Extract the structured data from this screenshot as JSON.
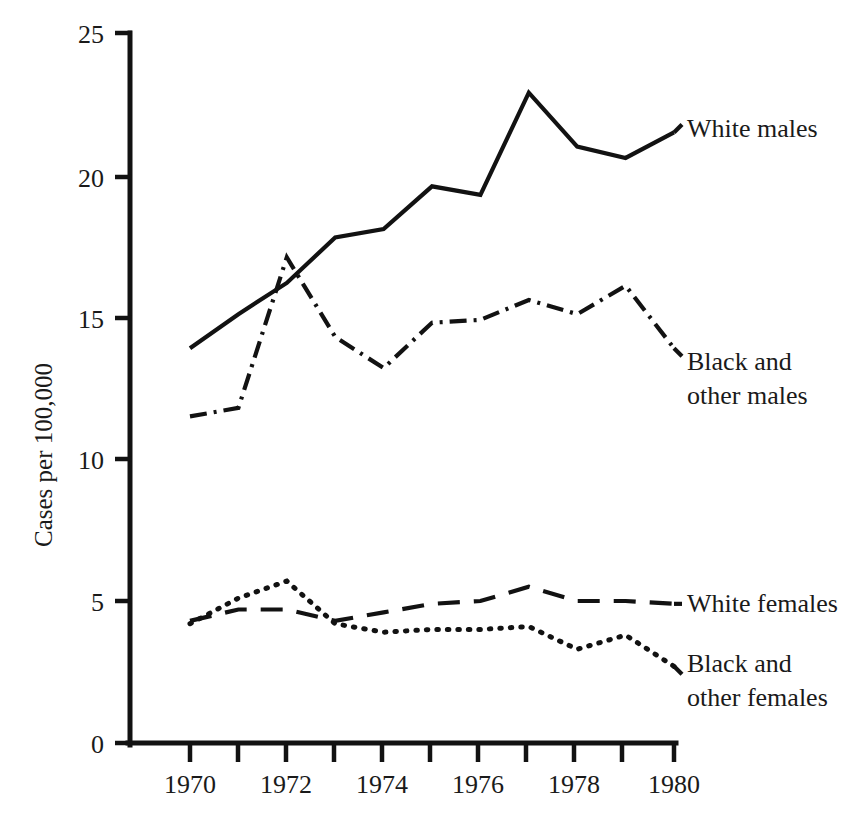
{
  "chart_data": {
    "type": "line",
    "title": "",
    "xlabel": "",
    "ylabel": "Cases per 100,000",
    "x": [
      1970,
      1971,
      1972,
      1973,
      1974,
      1975,
      1976,
      1977,
      1978,
      1979,
      1980
    ],
    "xlim": [
      1969.5,
      1980.5
    ],
    "ylim": [
      0,
      25
    ],
    "yticks": [
      0,
      5,
      10,
      15,
      20,
      25
    ],
    "ytick_labels": [
      "0",
      "5",
      "10",
      "15",
      "20",
      "25"
    ],
    "xticks": [
      1970,
      1971,
      1972,
      1973,
      1974,
      1975,
      1976,
      1977,
      1978,
      1979,
      1980
    ],
    "xtick_labels": [
      "1970",
      "",
      "1972",
      "",
      "1974",
      "",
      "1976",
      "",
      "1978",
      "",
      "1980"
    ],
    "xtick_labels_shown": [
      "1970",
      "1972",
      "1974",
      "1976",
      "1978",
      "1980"
    ],
    "grid": false,
    "legend_position": "right-inline-labels",
    "series": [
      {
        "name": "White males",
        "style": "solid",
        "values": [
          13.9,
          15.1,
          16.2,
          17.8,
          18.1,
          19.6,
          19.3,
          22.9,
          21.0,
          20.6,
          21.5
        ]
      },
      {
        "name": "Black and other males",
        "style": "dash-dot",
        "values": [
          11.5,
          11.8,
          17.1,
          14.3,
          13.2,
          14.8,
          14.9,
          15.6,
          15.1,
          16.1,
          13.9
        ]
      },
      {
        "name": "White females",
        "style": "dashed",
        "values": [
          4.3,
          4.7,
          4.7,
          4.3,
          4.6,
          4.9,
          5.0,
          5.5,
          5.0,
          5.0,
          4.9
        ]
      },
      {
        "name": "Black and other females",
        "style": "dotted",
        "values": [
          4.2,
          5.1,
          5.7,
          4.2,
          3.9,
          4.0,
          4.0,
          4.1,
          3.3,
          3.8,
          2.7
        ]
      }
    ],
    "annotations": [
      {
        "text": "White males",
        "lines": [
          "White males"
        ],
        "series": "White males"
      },
      {
        "text": "Black and other males",
        "lines": [
          "Black and",
          "other males"
        ],
        "series": "Black and other males"
      },
      {
        "text": "White females",
        "lines": [
          "White females"
        ],
        "series": "White females"
      },
      {
        "text": "Black and other females",
        "lines": [
          "Black and",
          "other females"
        ],
        "series": "Black and other females"
      }
    ],
    "colors": {
      "ink": "#121212",
      "background": "#ffffff"
    }
  },
  "labels": {
    "y_axis_title": "Cases per 100,000",
    "y_ticks": {
      "t25": "25",
      "t20": "20",
      "t15": "15",
      "t10": "10",
      "t5": "5",
      "t0": "0"
    },
    "x_ticks": {
      "x1970": "1970",
      "x1972": "1972",
      "x1974": "1974",
      "x1976": "1976",
      "x1978": "1978",
      "x1980": "1980"
    },
    "series": {
      "white_males": "White males",
      "black_other_males_l1": "Black and",
      "black_other_males_l2": "other males",
      "white_females": "White females",
      "black_other_females_l1": "Black and",
      "black_other_females_l2": "other females"
    }
  }
}
